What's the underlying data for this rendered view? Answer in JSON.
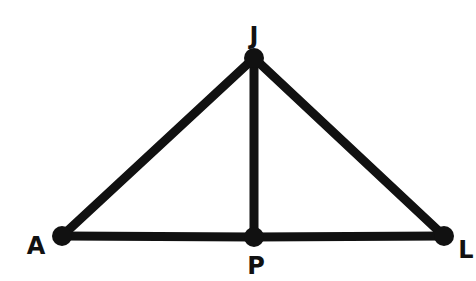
{
  "diagram": {
    "type": "geometry-triangle",
    "stroke_color": "#111111",
    "background": "#ffffff",
    "points": [
      {
        "id": "J",
        "label": "J",
        "x": 254,
        "y": 58,
        "label_x": 254,
        "label_y": 44
      },
      {
        "id": "A",
        "label": "A",
        "x": 62,
        "y": 236,
        "label_x": 36,
        "label_y": 254
      },
      {
        "id": "P",
        "label": "P",
        "x": 254,
        "y": 237,
        "label_x": 256,
        "label_y": 274
      },
      {
        "id": "L",
        "label": "L",
        "x": 444,
        "y": 236,
        "label_x": 466,
        "label_y": 258
      }
    ],
    "segments": [
      {
        "from": "A",
        "to": "J"
      },
      {
        "from": "J",
        "to": "L"
      },
      {
        "from": "J",
        "to": "P"
      },
      {
        "from": "A",
        "to": "P"
      },
      {
        "from": "P",
        "to": "L"
      }
    ]
  }
}
